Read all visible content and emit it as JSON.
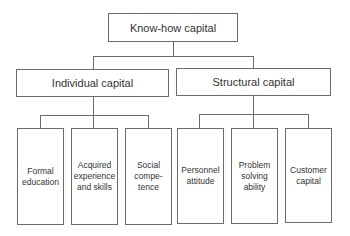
{
  "diagram": {
    "root": {
      "label": "Know-how capital"
    },
    "branches": [
      {
        "label": "Individual capital",
        "children": [
          {
            "label": "Formal education"
          },
          {
            "label": "Acquired experience and skills"
          },
          {
            "label": "Social compe-tence"
          }
        ]
      },
      {
        "label": "Structural capital",
        "children": [
          {
            "label": "Personnel attitude"
          },
          {
            "label": "Problem solving ability"
          },
          {
            "label": "Customer capital"
          }
        ]
      }
    ]
  }
}
